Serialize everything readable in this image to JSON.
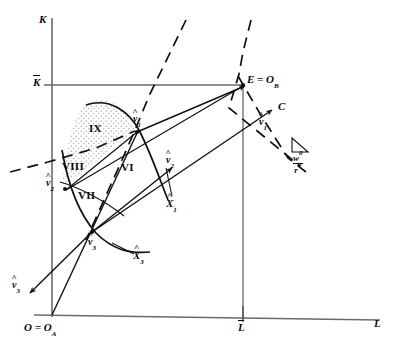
{
  "figure": {
    "kind": "economics-production-diagram",
    "background_color": "#ffffff",
    "line_color": "#111111",
    "axis_color": "#5a5a5a",
    "stipple_color": "#9b9b9b"
  },
  "axes": {
    "vertical_label": "K",
    "horizontal_label": "L",
    "origin_label": "O = O",
    "origin_sub": "A",
    "k_bar_label": "K",
    "l_bar_label": "L"
  },
  "points": [
    {
      "name": "origin",
      "label": "O = O",
      "sub": "A",
      "x": 52,
      "y": 315
    },
    {
      "name": "corner-E",
      "label": "E = O",
      "sub": "B",
      "x": 241,
      "y": 82
    },
    {
      "name": "point-C",
      "label": "C",
      "sub": "",
      "x": 276,
      "y": 108
    },
    {
      "name": "v1-hat-C",
      "label": "v",
      "sub": "1",
      "x": 258,
      "y": 121
    },
    {
      "name": "v1-hat",
      "label": "v",
      "sub": "1",
      "x": 136,
      "y": 118
    },
    {
      "name": "v2-hat-r",
      "label": "v",
      "sub": "2",
      "x": 163,
      "y": 157
    },
    {
      "name": "v2-hat-l",
      "label": "v",
      "sub": "2",
      "x": 56,
      "y": 182
    },
    {
      "name": "v3-hat",
      "label": "v",
      "sub": "3",
      "x": 94,
      "y": 240
    },
    {
      "name": "v3-hat-ar",
      "label": "v",
      "sub": "3",
      "x": 22,
      "y": 285
    },
    {
      "name": "x1-hat",
      "label": "X",
      "sub": "1",
      "x": 171,
      "y": 203
    },
    {
      "name": "x3-hat",
      "label": "X",
      "sub": "3",
      "x": 136,
      "y": 256
    }
  ],
  "regions": [
    {
      "name": "region-ix",
      "label": "IX",
      "x": 95,
      "y": 129
    },
    {
      "name": "region-viii",
      "label": "VIII",
      "x": 73,
      "y": 167
    },
    {
      "name": "region-vii",
      "label": "VII",
      "x": 87,
      "y": 196
    },
    {
      "name": "region-vi",
      "label": "VI",
      "x": 127,
      "y": 168
    }
  ],
  "slope_annotation": {
    "name": "wage-rental-ratio",
    "numerator": "w",
    "numerator_sup": "0",
    "denominator": "r",
    "denominator_sup": "0",
    "x": 300,
    "y": 152
  }
}
